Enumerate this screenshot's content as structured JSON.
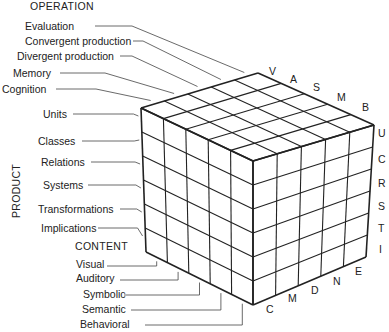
{
  "diagram": {
    "type": "structure-of-intellect-cube",
    "operation": {
      "title": "OPERATION",
      "items": [
        "Evaluation",
        "Convergent production",
        "Divergent production",
        "Memory",
        "Cognition"
      ],
      "edge_letters": [
        "V",
        "A",
        "S",
        "M",
        "B"
      ]
    },
    "product": {
      "title": "PRODUCT",
      "items": [
        "Units",
        "Classes",
        "Relations",
        "Systems",
        "Transformations",
        "Implications"
      ],
      "edge_letters": [
        "U",
        "C",
        "R",
        "S",
        "T",
        "I"
      ]
    },
    "content": {
      "title": "CONTENT",
      "items": [
        "Visual",
        "Auditory",
        "Symbolic",
        "Semantic",
        "Behavioral"
      ],
      "edge_letters": [
        "C",
        "M",
        "D",
        "N",
        "E"
      ]
    },
    "colors": {
      "line": "#222222",
      "leader": "#444444",
      "background": "#ffffff"
    }
  }
}
